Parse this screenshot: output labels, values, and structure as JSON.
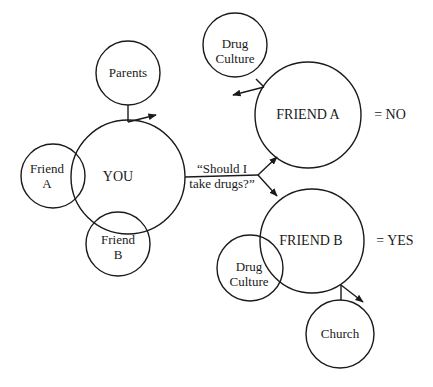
{
  "diagram": {
    "type": "influence-diagram",
    "nodes": {
      "parents": {
        "label": "Parents"
      },
      "you": {
        "label": "YOU"
      },
      "friend_a_small": {
        "line1": "Friend",
        "line2": "A"
      },
      "friend_b_small": {
        "line1": "Friend",
        "line2": "B"
      },
      "drug_culture_top": {
        "line1": "Drug",
        "line2": "Culture"
      },
      "friend_a_big": {
        "label": "FRIEND A"
      },
      "friend_b_big": {
        "label": "FRIEND B"
      },
      "drug_culture_bottom": {
        "line1": "Drug",
        "line2": "Culture"
      },
      "church": {
        "label": "Church"
      }
    },
    "question": {
      "line1": "“Should I",
      "line2": "take drugs?”"
    },
    "answers": {
      "friend_a": "=  NO",
      "friend_b": "=  YES"
    },
    "stroke_color": "#1a1a1a",
    "background": "#ffffff"
  }
}
